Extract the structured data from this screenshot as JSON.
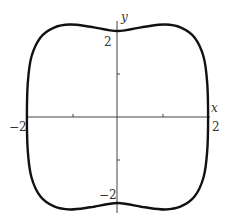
{
  "chart_data": {
    "type": "line",
    "title": "",
    "xlabel": "x",
    "ylabel": "y",
    "xlim": [
      -2,
      2
    ],
    "ylim": [
      -2.15,
      2.15
    ],
    "grid": false,
    "legend": null,
    "x_ticks": [
      -2,
      -1,
      1,
      2
    ],
    "y_ticks": [
      -2,
      -1,
      1,
      2
    ],
    "tick_labels": {
      "x": [
        "-2",
        "2"
      ],
      "y": [
        "2",
        "-2"
      ]
    },
    "tick_label_text": {
      "x_neg": "−2",
      "x_pos": "2",
      "y_pos": "2",
      "y_neg": "−2"
    },
    "series": [
      {
        "name": "closed curve",
        "description": "Closed, rounded-square-like curve symmetric about both axes; passes near (±2, 0) and (0, ±2); slight bumps near top and bottom at x≈±1 reaching |y|≈2.15",
        "x": [
          2.0,
          1.98,
          1.9,
          1.7,
          1.4,
          1.05,
          0.6,
          0.0,
          -0.6,
          -1.05,
          -1.4,
          -1.7,
          -1.9,
          -1.98,
          -2.0,
          -1.98,
          -1.9,
          -1.7,
          -1.4,
          -1.05,
          -0.6,
          0.0,
          0.6,
          1.05,
          1.4,
          1.7,
          1.9,
          1.98,
          2.0
        ],
        "y": [
          0.0,
          0.8,
          1.4,
          1.85,
          2.08,
          2.15,
          2.1,
          2.0,
          2.1,
          2.15,
          2.08,
          1.85,
          1.4,
          0.8,
          0.0,
          -0.8,
          -1.4,
          -1.85,
          -2.08,
          -2.15,
          -2.1,
          -2.0,
          -2.1,
          -2.15,
          -2.08,
          -1.85,
          -1.4,
          -0.8,
          0.0
        ]
      }
    ]
  },
  "axes": {
    "x_label": "x",
    "y_label": "y",
    "x_neg_label": "−2",
    "x_pos_label": "2",
    "y_pos_label": "2",
    "y_neg_label": "−2"
  }
}
